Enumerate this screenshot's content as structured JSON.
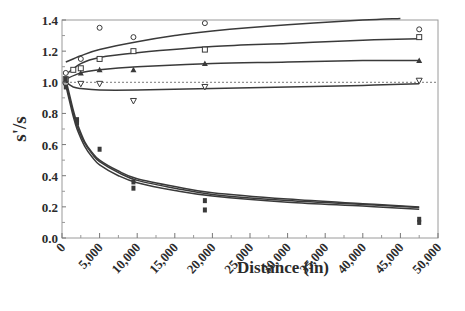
{
  "chart_data": {
    "type": "scatter",
    "title": "",
    "xlabel": "Distance (in)",
    "ylabel": "s'/s",
    "xlim": [
      0,
      50000
    ],
    "ylim": [
      0.0,
      1.4
    ],
    "grid": false,
    "legend": null,
    "x_ticks": [
      0,
      5000,
      10000,
      15000,
      20000,
      25000,
      30000,
      35000,
      40000,
      45000,
      50000
    ],
    "x_tick_labels": [
      "0",
      "5,000",
      "10,000",
      "15,000",
      "20,000",
      "25,000",
      "30,000",
      "35,000",
      "40,000",
      "45,000",
      "50,000"
    ],
    "y_ticks": [
      0.0,
      0.2,
      0.4,
      0.6,
      0.8,
      1.0,
      1.2,
      1.4
    ],
    "y_tick_labels": [
      "0.0",
      "0.2",
      "0.4",
      "0.6",
      "0.8",
      "1.0",
      "1.2",
      "1.4"
    ],
    "reference_line": {
      "y": 1.0,
      "style": "dotted"
    },
    "series": [
      {
        "name": "circle",
        "marker": "circle-open",
        "points": [
          [
            500,
            1.06
          ],
          [
            2500,
            1.15
          ],
          [
            5000,
            1.35
          ],
          [
            9500,
            1.29
          ],
          [
            19000,
            1.38
          ],
          [
            47500,
            1.34
          ]
        ],
        "fit_curve": [
          [
            500,
            1.13
          ],
          [
            2500,
            1.17
          ],
          [
            5000,
            1.21
          ],
          [
            10000,
            1.26
          ],
          [
            15000,
            1.3
          ],
          [
            20000,
            1.33
          ],
          [
            30000,
            1.37
          ],
          [
            40000,
            1.4
          ],
          [
            45000,
            1.41
          ]
        ]
      },
      {
        "name": "square",
        "marker": "square-open",
        "points": [
          [
            500,
            1.02
          ],
          [
            1500,
            1.08
          ],
          [
            2500,
            1.09
          ],
          [
            5000,
            1.15
          ],
          [
            9500,
            1.2
          ],
          [
            19000,
            1.21
          ],
          [
            47500,
            1.29
          ]
        ],
        "fit_curve": [
          [
            500,
            1.05
          ],
          [
            2500,
            1.12
          ],
          [
            5000,
            1.16
          ],
          [
            10000,
            1.19
          ],
          [
            20000,
            1.23
          ],
          [
            30000,
            1.25
          ],
          [
            40000,
            1.27
          ],
          [
            47500,
            1.28
          ]
        ]
      },
      {
        "name": "triangle-up",
        "marker": "triangle-up-filled",
        "points": [
          [
            500,
            1.0
          ],
          [
            2500,
            1.06
          ],
          [
            5000,
            1.08
          ],
          [
            9500,
            1.08
          ],
          [
            19000,
            1.12
          ],
          [
            47500,
            1.14
          ]
        ],
        "fit_curve": [
          [
            500,
            1.02
          ],
          [
            2500,
            1.06
          ],
          [
            5000,
            1.08
          ],
          [
            10000,
            1.1
          ],
          [
            20000,
            1.12
          ],
          [
            30000,
            1.13
          ],
          [
            40000,
            1.14
          ],
          [
            47500,
            1.14
          ]
        ]
      },
      {
        "name": "triangle-down",
        "marker": "triangle-down-open",
        "points": [
          [
            500,
            0.98
          ],
          [
            2500,
            0.99
          ],
          [
            5000,
            0.99
          ],
          [
            9500,
            0.88
          ],
          [
            19000,
            0.97
          ],
          [
            47500,
            1.01
          ]
        ],
        "fit_curve": [
          [
            500,
            1.0
          ],
          [
            1500,
            0.97
          ],
          [
            2500,
            0.96
          ],
          [
            5000,
            0.95
          ],
          [
            10000,
            0.95
          ],
          [
            20000,
            0.96
          ],
          [
            30000,
            0.97
          ],
          [
            40000,
            0.98
          ],
          [
            47500,
            0.99
          ]
        ]
      },
      {
        "name": "decay-group",
        "marker": "square-filled",
        "points": [
          [
            500,
            0.97
          ],
          [
            500,
            1.02
          ],
          [
            2000,
            0.76
          ],
          [
            2000,
            0.74
          ],
          [
            5000,
            0.57
          ],
          [
            9500,
            0.36
          ],
          [
            9500,
            0.32
          ],
          [
            19000,
            0.24
          ],
          [
            19000,
            0.18
          ],
          [
            47500,
            0.12
          ],
          [
            47500,
            0.1
          ]
        ],
        "fit_curves": [
          [
            [
              500,
              1.02
            ],
            [
              1000,
              0.92
            ],
            [
              1500,
              0.82
            ],
            [
              2000,
              0.74
            ],
            [
              3000,
              0.62
            ],
            [
              4000,
              0.55
            ],
            [
              5000,
              0.5
            ],
            [
              7500,
              0.43
            ],
            [
              10000,
              0.38
            ],
            [
              15000,
              0.33
            ],
            [
              20000,
              0.29
            ],
            [
              30000,
              0.25
            ],
            [
              40000,
              0.22
            ],
            [
              47500,
              0.2
            ]
          ],
          [
            [
              500,
              1.0
            ],
            [
              1000,
              0.9
            ],
            [
              1500,
              0.8
            ],
            [
              2000,
              0.72
            ],
            [
              3000,
              0.61
            ],
            [
              4000,
              0.54
            ],
            [
              5000,
              0.49
            ],
            [
              7500,
              0.42
            ],
            [
              10000,
              0.37
            ],
            [
              15000,
              0.32
            ],
            [
              20000,
              0.28
            ],
            [
              30000,
              0.24
            ],
            [
              40000,
              0.215
            ],
            [
              47500,
              0.195
            ]
          ],
          [
            [
              500,
              0.98
            ],
            [
              1000,
              0.88
            ],
            [
              1500,
              0.78
            ],
            [
              2000,
              0.7
            ],
            [
              3000,
              0.59
            ],
            [
              4000,
              0.52
            ],
            [
              5000,
              0.47
            ],
            [
              7500,
              0.4
            ],
            [
              10000,
              0.355
            ],
            [
              15000,
              0.305
            ],
            [
              20000,
              0.27
            ],
            [
              30000,
              0.23
            ],
            [
              40000,
              0.205
            ],
            [
              47500,
              0.185
            ]
          ]
        ]
      }
    ]
  }
}
